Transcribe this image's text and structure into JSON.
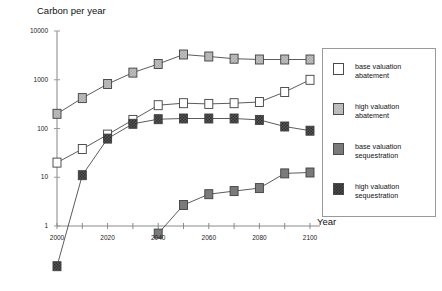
{
  "chart_data": {
    "type": "line",
    "title": "Carbon per year",
    "xlabel": "Year",
    "ylabel": "",
    "yscale": "log",
    "ylim": [
      1,
      10000
    ],
    "xlim": [
      2000,
      2100
    ],
    "grid": false,
    "legend_position": "right",
    "ytick_labels": [
      "10000",
      "1000",
      "100",
      "10",
      "1"
    ],
    "ytick_values": [
      10000,
      1000,
      100,
      10,
      1
    ],
    "xtick_labels": [
      "2000",
      "2020",
      "2040",
      "2060",
      "2080",
      "2100"
    ],
    "xtick_values": [
      2000,
      2020,
      2040,
      2060,
      2080,
      2100
    ],
    "x_minor_step": 10,
    "x": [
      2000,
      2010,
      2020,
      2030,
      2040,
      2050,
      2060,
      2070,
      2080,
      2090,
      2100
    ],
    "series": [
      {
        "name": "base valuation abatement",
        "marker": "square-open",
        "color": "#ffffff",
        "values": [
          20,
          38,
          75,
          150,
          300,
          330,
          320,
          330,
          350,
          560,
          1000
        ]
      },
      {
        "name": "high valuation abatement",
        "marker": "square-light-hatch",
        "color": "#bdbdbd",
        "values": [
          200,
          420,
          820,
          1400,
          2100,
          3300,
          3000,
          2700,
          2600,
          2600,
          2600
        ]
      },
      {
        "name": "base valuation sequestration",
        "marker": "square-gray",
        "color": "#7a7a7a",
        "values": [
          null,
          null,
          null,
          null,
          0.7,
          2.7,
          4.5,
          5.2,
          6.0,
          12,
          12.5
        ]
      },
      {
        "name": "high valuation sequestration",
        "marker": "square-dark-hatch",
        "color": "#4a4a4a",
        "values": [
          0.15,
          11,
          62,
          125,
          155,
          160,
          160,
          160,
          150,
          110,
          90
        ]
      }
    ]
  },
  "legend": {
    "items": [
      {
        "label": "base valuation\nabatement",
        "swatch": "sw-base-ab"
      },
      {
        "label": "high valuation\nabatement",
        "swatch": "sw-high-ab"
      },
      {
        "label": "base valuation\nsequestration",
        "swatch": "sw-base-seq"
      },
      {
        "label": "high valuation\nsequestration",
        "swatch": "sw-high-seq"
      }
    ]
  }
}
